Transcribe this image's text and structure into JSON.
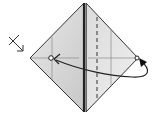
{
  "diagram": {
    "type": "origami-fold-step",
    "background": "#ffffff",
    "paper": {
      "left_face_fill": "#d9d9d9",
      "right_face_fill": "#e6e6e6",
      "outline_color": "#333333",
      "vertices": {
        "top": [
          84,
          3
        ],
        "right": [
          138,
          58
        ],
        "bottom": [
          84,
          112
        ],
        "left": [
          30,
          58
        ]
      }
    },
    "lines": {
      "center_crease": {
        "x": 84,
        "color": "#222222",
        "width": 2.2
      },
      "dashed_valley_fold": {
        "x": 97,
        "color": "#444444"
      },
      "left_reference_crease": {
        "x": 52,
        "color": "#888888"
      },
      "right_reference_crease": {
        "x": 111,
        "color": "#888888"
      },
      "horizontal_crease": {
        "y": 58,
        "color": "#888888"
      }
    },
    "markers": {
      "target_point": {
        "x": 51,
        "y": 58,
        "label": "target-circle"
      },
      "source_point": {
        "x": 137,
        "y": 58,
        "label": "source-circle"
      }
    },
    "symbols": {
      "fold_arrow": {
        "color": "#222222",
        "description": "curved arrow from right corner to left reference point"
      },
      "turn_over_symbol": {
        "position": [
          8,
          34
        ],
        "description": "x-arrow pointing toward left corner"
      }
    }
  }
}
